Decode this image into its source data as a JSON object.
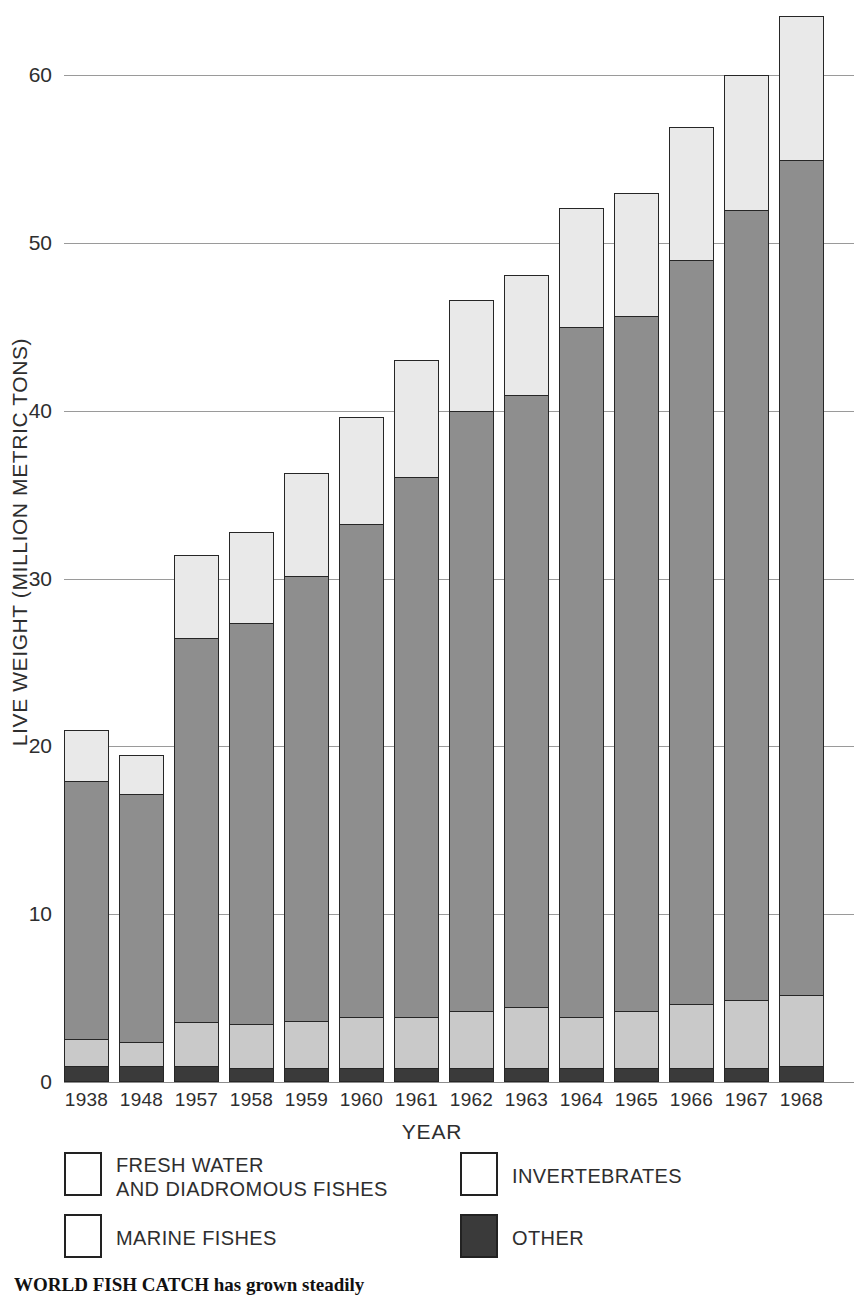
{
  "chart_data": {
    "type": "bar",
    "stacked": true,
    "title": "WORLD FISH CATCH",
    "xlabel": "YEAR",
    "ylabel": "LIVE WEIGHT (MILLION METRIC TONS)",
    "ylim": [
      0,
      64
    ],
    "yticks": [
      0,
      10,
      20,
      30,
      40,
      50,
      60
    ],
    "grid": "horizontal",
    "legend_position": "below-plot",
    "categories": [
      "1938",
      "1948",
      "1957",
      "1958",
      "1959",
      "1960",
      "1961",
      "1962",
      "1963",
      "1964",
      "1965",
      "1966",
      "1967",
      "1968"
    ],
    "series": [
      {
        "name": "OTHER",
        "color": "#3a3a3a",
        "values": [
          0.9,
          0.9,
          0.9,
          0.8,
          0.8,
          0.8,
          0.8,
          0.8,
          0.8,
          0.8,
          0.8,
          0.8,
          0.8,
          0.9
        ]
      },
      {
        "name": "FRESH WATER AND DIADROMOUS FISHES",
        "color": "#c9c9c9",
        "values": [
          1.6,
          1.4,
          2.6,
          2.6,
          2.8,
          3.0,
          3.0,
          3.4,
          3.6,
          3.0,
          3.4,
          3.8,
          4.0,
          4.2
        ]
      },
      {
        "name": "MARINE FISHES",
        "color": "#8e8e8e",
        "values": [
          15.4,
          14.8,
          22.9,
          23.9,
          26.5,
          29.4,
          32.2,
          35.7,
          36.5,
          41.1,
          41.4,
          44.3,
          47.1,
          49.8
        ]
      },
      {
        "name": "INVERTEBRATES",
        "color": "#e9e9e9",
        "values": [
          3.1,
          2.4,
          5.0,
          5.5,
          6.2,
          6.4,
          7.0,
          6.7,
          7.2,
          7.2,
          7.4,
          8.0,
          8.1,
          8.6
        ]
      }
    ],
    "totals": [
      21.0,
      19.5,
      31.4,
      32.8,
      36.3,
      39.6,
      43.0,
      46.6,
      48.1,
      52.1,
      53.0,
      56.9,
      60.0,
      63.5
    ]
  },
  "axis": {
    "y_title": "LIVE WEIGHT (MILLION METRIC TONS)",
    "x_title": "YEAR",
    "y_tick_labels": [
      "0",
      "10",
      "20",
      "30",
      "40",
      "50",
      "60"
    ]
  },
  "legend": {
    "items": [
      {
        "label": "FRESH WATER\nAND DIADROMOUS FISHES",
        "swatch": "white"
      },
      {
        "label": "INVERTEBRATES",
        "swatch": "white"
      },
      {
        "label": "MARINE FISHES",
        "swatch": "white"
      },
      {
        "label": "OTHER",
        "swatch": "dark"
      }
    ]
  },
  "caption": {
    "text": "WORLD FISH CATCH has grown steadily"
  }
}
